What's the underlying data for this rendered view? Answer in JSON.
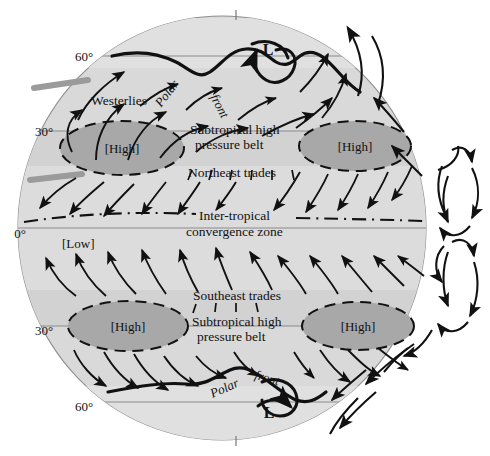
{
  "figure": {
    "type": "diagram",
    "background_color": "#ffffff",
    "globe_fill": "#d9d9d9",
    "band_fill": "#cccccc",
    "high_cell_fill": "#a8a8a8",
    "line_color": "#1a1a1a",
    "parallel_color": "#8a8a8a",
    "pole_tick_color": "#777777",
    "gray_bar_color": "#9b9b9b"
  },
  "latitudes": {
    "north_60": "60°",
    "north_30": "30°",
    "equator": "0°",
    "south_30": "30°",
    "south_60": "60°"
  },
  "pressure_cells": {
    "north_high_left": "[High]",
    "north_high_right": "[High]",
    "south_high_left": "[High]",
    "south_high_right": "[High]",
    "equatorial_low": "[Low]",
    "north_low_L": "L",
    "south_low_L": "L"
  },
  "wind_belts": {
    "westerlies": "Westerlies",
    "northeast_trades": "Northeast trades",
    "southeast_trades": "Southeast trades"
  },
  "fronts": {
    "north_polar_word": "Polar",
    "north_front_word": "front",
    "south_polar_word": "Polar",
    "south_front_word": "front"
  },
  "belts": {
    "subtropical_high_north_line1": "Subtropical high",
    "subtropical_high_north_line2": "pressure belt",
    "subtropical_high_south_line1": "Subtropical high",
    "subtropical_high_south_line2": "pressure belt",
    "itcz_line1": "Inter-tropical",
    "itcz_line2": "convergence zone"
  }
}
